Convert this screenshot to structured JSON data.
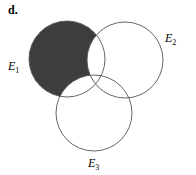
{
  "panel_label": "d.",
  "sets": [
    {
      "name": "E",
      "subscript": "1",
      "cx": 67,
      "cy": 59,
      "r": 38,
      "label_x": 8,
      "label_y": 70
    },
    {
      "name": "E",
      "subscript": "2",
      "cx": 125,
      "cy": 60,
      "r": 38,
      "label_x": 165,
      "label_y": 42
    },
    {
      "name": "E",
      "subscript": "3",
      "cx": 94,
      "cy": 113,
      "r": 38,
      "label_x": 88,
      "label_y": 167
    }
  ],
  "shaded_region": "E1 only (E1 minus E2 and E3)",
  "colors": {
    "shade": "#3d3d3d",
    "stroke": "#555555",
    "background": "#ffffff"
  }
}
